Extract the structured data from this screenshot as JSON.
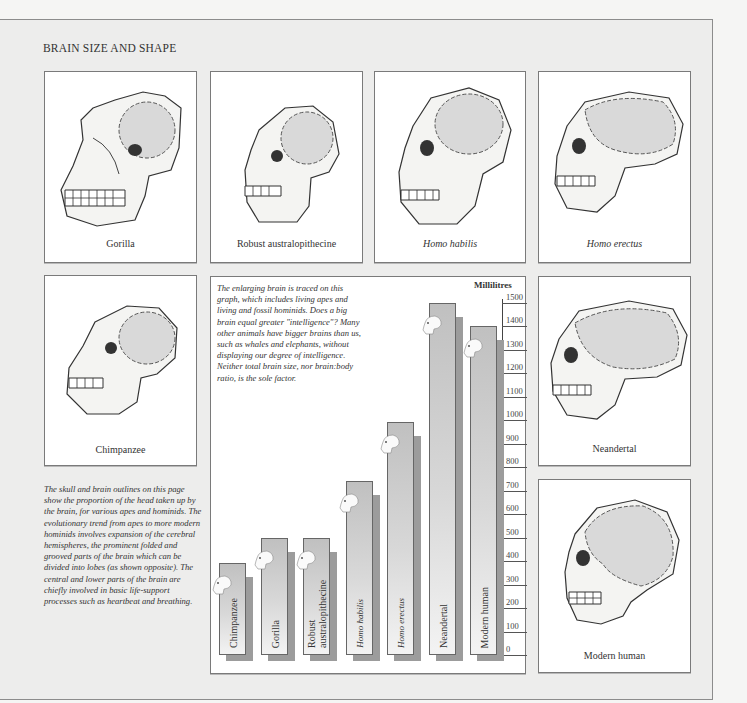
{
  "page": {
    "title": "BRAIN SIZE AND SHAPE",
    "left_note": "The skull and brain outlines on this page show the proportion of the head taken up by the brain, for various apes and hominids. The evolutionary trend from apes to more modern hominids involves expansion of the cerebral hemispheres, the prominent folded and grooved parts of the brain which can be divided into lobes (as shown opposite). The central and lower parts of the brain are chiefly involved in basic life-support processes such as heartbeat and breathing."
  },
  "panels": [
    {
      "id": "gorilla",
      "caption": "Gorilla",
      "italic": false
    },
    {
      "id": "robust",
      "caption": "Robust australopithecine",
      "italic": false
    },
    {
      "id": "habilis",
      "caption": "Homo habilis",
      "italic": true
    },
    {
      "id": "erectus",
      "caption": "Homo erectus",
      "italic": true
    },
    {
      "id": "chimp",
      "caption": "Chimpanzee",
      "italic": false
    },
    {
      "id": "neandertal",
      "caption": "Neandertal",
      "italic": false
    },
    {
      "id": "modern",
      "caption": "Modern human",
      "italic": false
    }
  ],
  "graph": {
    "note": "The enlarging brain is traced on this graph, which includes living apes and living and fossil hominids. Does a big brain equal greater \"intelligence\"? Many other animals have bigger brains than us, such as whales and elephants, without displaying our degree of intelligence. Neither total brain size, nor brain:body ratio, is the sole factor.",
    "ylabel": "Millilitres"
  },
  "chart_data": {
    "type": "bar",
    "title": "Brain size",
    "xlabel": "",
    "ylabel": "Millilitres",
    "ylim": [
      0,
      1500
    ],
    "yticks": [
      0,
      100,
      200,
      300,
      400,
      500,
      600,
      700,
      800,
      900,
      1000,
      1100,
      1200,
      1300,
      1400,
      1500
    ],
    "categories": [
      "Chimpanzee",
      "Gorilla",
      "Robust australopithecine",
      "Homo habilis",
      "Homo erectus",
      "Neandertal",
      "Modern human"
    ],
    "values": [
      390,
      500,
      500,
      740,
      990,
      1500,
      1400
    ],
    "grid": false,
    "legend": "none",
    "bar_labels_rotated": true
  }
}
